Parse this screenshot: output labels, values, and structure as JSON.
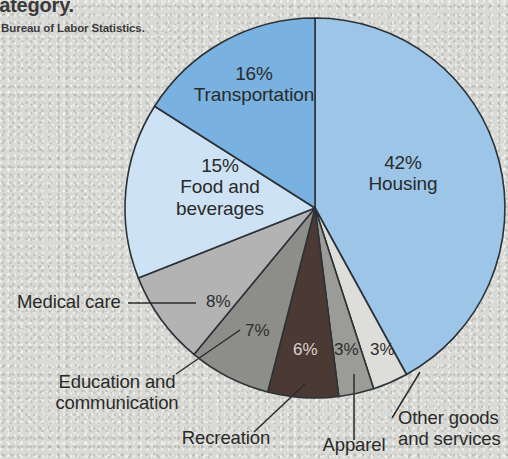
{
  "header": {
    "title_fragment": "s category.",
    "source_fragment": "e: Bureau of Labor Statistics."
  },
  "colors": {
    "housing": "#9cc5e8",
    "transportation": "#79b2e0",
    "food_and_beverages": "#cde2f4",
    "medical_care": "#b3b3b3",
    "education_and_communication": "#8d8d8a",
    "recreation": "#4b3a33",
    "apparel": "#9b9b97",
    "other_goods_and_services": "#ddddd9",
    "outline": "#2c3238",
    "background": "#d9d9d5",
    "text": "#2a2a2a"
  },
  "chart_data": {
    "type": "pie",
    "title": "",
    "legend_position": "labels-on-slices",
    "categories": [
      "Housing",
      "Other goods and services",
      "Apparel",
      "Recreation",
      "Education and communication",
      "Medical care",
      "Food and beverages",
      "Transportation"
    ],
    "values": [
      42,
      3,
      3,
      6,
      7,
      8,
      15,
      16
    ],
    "units": "percent",
    "slices": [
      {
        "name": "Housing",
        "value": 42,
        "label": "42%",
        "color": "#9cc5e8"
      },
      {
        "name": "Other goods and services",
        "value": 3,
        "label": "3%",
        "color": "#ddddd9"
      },
      {
        "name": "Apparel",
        "value": 3,
        "label": "3%",
        "color": "#9b9b97"
      },
      {
        "name": "Recreation",
        "value": 6,
        "label": "6%",
        "color": "#4b3a33"
      },
      {
        "name": "Education and communication",
        "value": 7,
        "label": "7%",
        "color": "#8d8d8a"
      },
      {
        "name": "Medical care",
        "value": 8,
        "label": "8%",
        "color": "#b3b3b3"
      },
      {
        "name": "Food and beverages",
        "value": 15,
        "label": "15%",
        "color": "#cde2f4"
      },
      {
        "name": "Transportation",
        "value": 16,
        "label": "16%",
        "color": "#79b2e0"
      }
    ]
  },
  "labels": {
    "housing": {
      "pct": "42%",
      "name": "Housing"
    },
    "transportation": {
      "pct": "16%",
      "name": "Transportation"
    },
    "food": {
      "pct": "15%",
      "line1": "Food and",
      "line2": "beverages"
    },
    "medical_pct": "8%",
    "medical_name": "Medical care",
    "education_pct": "7%",
    "education_line1": "Education and",
    "education_line2": "communication",
    "recreation_pct": "6%",
    "recreation_name": "Recreation",
    "apparel_pct": "3%",
    "apparel_name": "Apparel",
    "other_pct": "3%",
    "other_line1": "Other goods",
    "other_line2": "and services"
  }
}
